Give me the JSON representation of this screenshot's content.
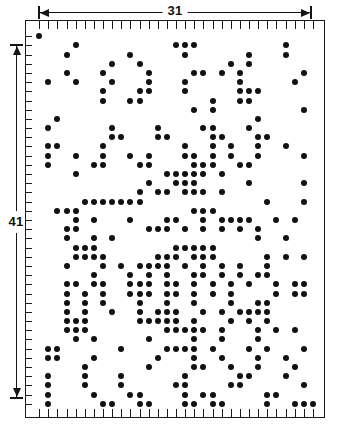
{
  "figure": {
    "title": "",
    "background_color": "#ffffff",
    "ink_color": "#111111"
  },
  "dimensions": {
    "horizontal": {
      "label": "31",
      "name": "width-dimension",
      "units": "columns"
    },
    "vertical": {
      "label": "41",
      "name": "height-dimension",
      "units": "rows"
    }
  },
  "chart_data": {
    "type": "scatter",
    "title": "",
    "xlabel": "",
    "ylabel": "",
    "grid": false,
    "legend": null,
    "xlim": [
      0,
      31
    ],
    "ylim": [
      0,
      41
    ],
    "x_ticks_count": 31,
    "y_ticks_count": 41,
    "tick_labels": [],
    "annotations": [
      {
        "text": "31",
        "position": "top",
        "kind": "dimension-arrow"
      },
      {
        "text": "41",
        "position": "left",
        "kind": "dimension-arrow"
      }
    ],
    "marker": "filled-circle",
    "marker_color": "#111111",
    "marker_size_px": 6,
    "cols": 31,
    "rows": 41,
    "points": [
      [
        1,
        0
      ],
      [
        5,
        1
      ],
      [
        16,
        1
      ],
      [
        17,
        1
      ],
      [
        18,
        1
      ],
      [
        28,
        1
      ],
      [
        4,
        2
      ],
      [
        11,
        2
      ],
      [
        17,
        2
      ],
      [
        24,
        2
      ],
      [
        28,
        2
      ],
      [
        9,
        3
      ],
      [
        12,
        3
      ],
      [
        22,
        3
      ],
      [
        24,
        3
      ],
      [
        4,
        4
      ],
      [
        8,
        4
      ],
      [
        13,
        4
      ],
      [
        18,
        4
      ],
      [
        19,
        4
      ],
      [
        21,
        4
      ],
      [
        23,
        4
      ],
      [
        30,
        4
      ],
      [
        2,
        5
      ],
      [
        5,
        5
      ],
      [
        9,
        5
      ],
      [
        13,
        5
      ],
      [
        17,
        5
      ],
      [
        23,
        5
      ],
      [
        29,
        5
      ],
      [
        8,
        6
      ],
      [
        12,
        6
      ],
      [
        13,
        6
      ],
      [
        17,
        6
      ],
      [
        23,
        6
      ],
      [
        24,
        6
      ],
      [
        25,
        6
      ],
      [
        8,
        7
      ],
      [
        11,
        7
      ],
      [
        12,
        7
      ],
      [
        20,
        7
      ],
      [
        23,
        7
      ],
      [
        24,
        7
      ],
      [
        18,
        8
      ],
      [
        20,
        8
      ],
      [
        30,
        8
      ],
      [
        3,
        9
      ],
      [
        25,
        9
      ],
      [
        2,
        10
      ],
      [
        9,
        10
      ],
      [
        14,
        10
      ],
      [
        19,
        10
      ],
      [
        20,
        10
      ],
      [
        24,
        10
      ],
      [
        9,
        11
      ],
      [
        10,
        11
      ],
      [
        14,
        11
      ],
      [
        15,
        11
      ],
      [
        20,
        11
      ],
      [
        21,
        11
      ],
      [
        25,
        11
      ],
      [
        26,
        11
      ],
      [
        2,
        12
      ],
      [
        3,
        12
      ],
      [
        8,
        12
      ],
      [
        17,
        12
      ],
      [
        20,
        12
      ],
      [
        22,
        12
      ],
      [
        25,
        12
      ],
      [
        28,
        12
      ],
      [
        2,
        13
      ],
      [
        5,
        13
      ],
      [
        8,
        13
      ],
      [
        11,
        13
      ],
      [
        13,
        13
      ],
      [
        17,
        13
      ],
      [
        18,
        13
      ],
      [
        20,
        13
      ],
      [
        22,
        13
      ],
      [
        25,
        13
      ],
      [
        30,
        13
      ],
      [
        2,
        14
      ],
      [
        7,
        14
      ],
      [
        8,
        14
      ],
      [
        12,
        14
      ],
      [
        13,
        14
      ],
      [
        18,
        14
      ],
      [
        19,
        14
      ],
      [
        20,
        14
      ],
      [
        23,
        14
      ],
      [
        24,
        14
      ],
      [
        5,
        15
      ],
      [
        15,
        15
      ],
      [
        16,
        15
      ],
      [
        17,
        15
      ],
      [
        18,
        15
      ],
      [
        19,
        15
      ],
      [
        21,
        15
      ],
      [
        13,
        16
      ],
      [
        16,
        16
      ],
      [
        17,
        16
      ],
      [
        18,
        16
      ],
      [
        24,
        16
      ],
      [
        30,
        16
      ],
      [
        12,
        17
      ],
      [
        14,
        17
      ],
      [
        15,
        17
      ],
      [
        17,
        17
      ],
      [
        18,
        17
      ],
      [
        19,
        17
      ],
      [
        21,
        17
      ],
      [
        6,
        18
      ],
      [
        7,
        18
      ],
      [
        8,
        18
      ],
      [
        9,
        18
      ],
      [
        10,
        18
      ],
      [
        11,
        18
      ],
      [
        12,
        18
      ],
      [
        26,
        18
      ],
      [
        30,
        18
      ],
      [
        3,
        19
      ],
      [
        4,
        19
      ],
      [
        5,
        19
      ],
      [
        18,
        19
      ],
      [
        19,
        19
      ],
      [
        20,
        19
      ],
      [
        5,
        20
      ],
      [
        7,
        20
      ],
      [
        11,
        20
      ],
      [
        15,
        20
      ],
      [
        16,
        20
      ],
      [
        19,
        20
      ],
      [
        21,
        20
      ],
      [
        22,
        20
      ],
      [
        23,
        20
      ],
      [
        24,
        20
      ],
      [
        27,
        20
      ],
      [
        29,
        20
      ],
      [
        4,
        21
      ],
      [
        5,
        21
      ],
      [
        13,
        21
      ],
      [
        14,
        21
      ],
      [
        15,
        21
      ],
      [
        17,
        21
      ],
      [
        19,
        21
      ],
      [
        21,
        21
      ],
      [
        23,
        21
      ],
      [
        25,
        21
      ],
      [
        4,
        22
      ],
      [
        7,
        22
      ],
      [
        9,
        22
      ],
      [
        25,
        22
      ],
      [
        28,
        22
      ],
      [
        5,
        23
      ],
      [
        6,
        23
      ],
      [
        7,
        23
      ],
      [
        16,
        23
      ],
      [
        17,
        23
      ],
      [
        18,
        23
      ],
      [
        19,
        23
      ],
      [
        20,
        23
      ],
      [
        5,
        24
      ],
      [
        6,
        24
      ],
      [
        7,
        24
      ],
      [
        8,
        24
      ],
      [
        14,
        24
      ],
      [
        15,
        24
      ],
      [
        16,
        24
      ],
      [
        18,
        24
      ],
      [
        19,
        24
      ],
      [
        20,
        24
      ],
      [
        26,
        24
      ],
      [
        28,
        24
      ],
      [
        30,
        24
      ],
      [
        4,
        25
      ],
      [
        8,
        25
      ],
      [
        10,
        25
      ],
      [
        12,
        25
      ],
      [
        13,
        25
      ],
      [
        14,
        25
      ],
      [
        15,
        25
      ],
      [
        17,
        25
      ],
      [
        19,
        25
      ],
      [
        21,
        25
      ],
      [
        23,
        25
      ],
      [
        26,
        25
      ],
      [
        7,
        26
      ],
      [
        11,
        26
      ],
      [
        13,
        26
      ],
      [
        15,
        26
      ],
      [
        18,
        26
      ],
      [
        19,
        26
      ],
      [
        21,
        26
      ],
      [
        23,
        26
      ],
      [
        25,
        26
      ],
      [
        26,
        26
      ],
      [
        4,
        27
      ],
      [
        5,
        27
      ],
      [
        7,
        27
      ],
      [
        8,
        27
      ],
      [
        11,
        27
      ],
      [
        12,
        27
      ],
      [
        13,
        27
      ],
      [
        15,
        27
      ],
      [
        16,
        27
      ],
      [
        18,
        27
      ],
      [
        20,
        27
      ],
      [
        22,
        27
      ],
      [
        24,
        27
      ],
      [
        27,
        27
      ],
      [
        29,
        27
      ],
      [
        30,
        27
      ],
      [
        4,
        28
      ],
      [
        6,
        28
      ],
      [
        8,
        28
      ],
      [
        11,
        28
      ],
      [
        12,
        28
      ],
      [
        13,
        28
      ],
      [
        15,
        28
      ],
      [
        16,
        28
      ],
      [
        18,
        28
      ],
      [
        20,
        28
      ],
      [
        22,
        28
      ],
      [
        27,
        28
      ],
      [
        29,
        28
      ],
      [
        30,
        28
      ],
      [
        4,
        29
      ],
      [
        6,
        29
      ],
      [
        8,
        29
      ],
      [
        12,
        29
      ],
      [
        15,
        29
      ],
      [
        18,
        29
      ],
      [
        22,
        29
      ],
      [
        25,
        29
      ],
      [
        26,
        29
      ],
      [
        4,
        30
      ],
      [
        6,
        30
      ],
      [
        9,
        30
      ],
      [
        12,
        30
      ],
      [
        14,
        30
      ],
      [
        15,
        30
      ],
      [
        16,
        30
      ],
      [
        19,
        30
      ],
      [
        21,
        30
      ],
      [
        23,
        30
      ],
      [
        24,
        30
      ],
      [
        25,
        30
      ],
      [
        26,
        30
      ],
      [
        4,
        31
      ],
      [
        5,
        31
      ],
      [
        6,
        31
      ],
      [
        12,
        31
      ],
      [
        13,
        31
      ],
      [
        14,
        31
      ],
      [
        15,
        31
      ],
      [
        16,
        31
      ],
      [
        18,
        31
      ],
      [
        22,
        31
      ],
      [
        24,
        31
      ],
      [
        26,
        31
      ],
      [
        4,
        32
      ],
      [
        5,
        32
      ],
      [
        6,
        32
      ],
      [
        15,
        32
      ],
      [
        16,
        32
      ],
      [
        17,
        32
      ],
      [
        18,
        32
      ],
      [
        19,
        32
      ],
      [
        21,
        32
      ],
      [
        25,
        32
      ],
      [
        27,
        32
      ],
      [
        29,
        32
      ],
      [
        5,
        33
      ],
      [
        7,
        33
      ],
      [
        13,
        33
      ],
      [
        18,
        33
      ],
      [
        21,
        33
      ],
      [
        25,
        33
      ],
      [
        2,
        34
      ],
      [
        3,
        34
      ],
      [
        10,
        34
      ],
      [
        15,
        34
      ],
      [
        16,
        34
      ],
      [
        17,
        34
      ],
      [
        18,
        34
      ],
      [
        20,
        34
      ],
      [
        24,
        34
      ],
      [
        26,
        34
      ],
      [
        30,
        34
      ],
      [
        2,
        35
      ],
      [
        3,
        35
      ],
      [
        7,
        35
      ],
      [
        14,
        35
      ],
      [
        18,
        35
      ],
      [
        21,
        35
      ],
      [
        25,
        35
      ],
      [
        28,
        35
      ],
      [
        6,
        36
      ],
      [
        13,
        36
      ],
      [
        18,
        36
      ],
      [
        19,
        36
      ],
      [
        22,
        36
      ],
      [
        25,
        36
      ],
      [
        29,
        36
      ],
      [
        2,
        37
      ],
      [
        6,
        37
      ],
      [
        10,
        37
      ],
      [
        17,
        37
      ],
      [
        23,
        37
      ],
      [
        24,
        37
      ],
      [
        28,
        37
      ],
      [
        2,
        38
      ],
      [
        6,
        38
      ],
      [
        10,
        38
      ],
      [
        16,
        38
      ],
      [
        17,
        38
      ],
      [
        22,
        38
      ],
      [
        23,
        38
      ],
      [
        30,
        38
      ],
      [
        2,
        39
      ],
      [
        7,
        39
      ],
      [
        11,
        39
      ],
      [
        12,
        39
      ],
      [
        17,
        39
      ],
      [
        19,
        39
      ],
      [
        20,
        39
      ],
      [
        26,
        39
      ],
      [
        27,
        39
      ],
      [
        2,
        40
      ],
      [
        8,
        40
      ],
      [
        9,
        40
      ],
      [
        12,
        40
      ],
      [
        13,
        40
      ],
      [
        17,
        40
      ],
      [
        18,
        40
      ],
      [
        20,
        40
      ],
      [
        21,
        40
      ],
      [
        26,
        40
      ],
      [
        29,
        40
      ],
      [
        30,
        40
      ],
      [
        31,
        40
      ]
    ]
  }
}
